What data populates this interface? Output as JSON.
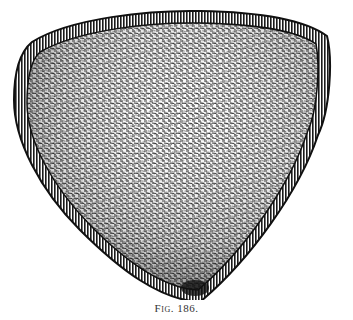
{
  "figure": {
    "style": "engraving",
    "colors": {
      "ink": "#1a1a1a",
      "paper": "#ffffff",
      "mid": "#555555"
    }
  },
  "caption": {
    "label": "Fig. 186."
  }
}
